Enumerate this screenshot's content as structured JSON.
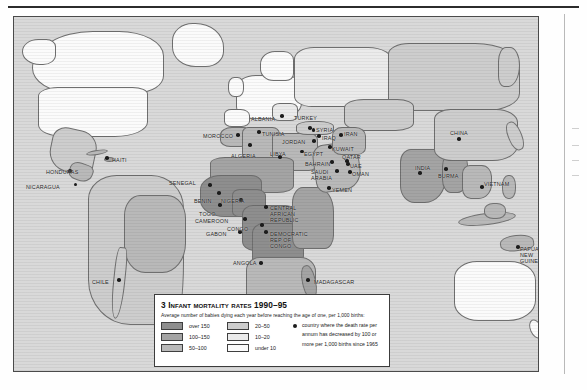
{
  "page": {
    "figure_number": "3",
    "map_title": "Infant mortality rates 1990–95"
  },
  "legend": {
    "title_number": "3",
    "title_text": "Infant mortality rates 1990–95",
    "subtitle": "Average number of babies dying each year before reaching the age of one, per 1,000 births:",
    "swatch_keys": [
      {
        "label": "over 150",
        "color": "#8e8e8e"
      },
      {
        "label": "100–150",
        "color": "#a4a4a4"
      },
      {
        "label": "50–100",
        "color": "#b9b9b9"
      },
      {
        "label": "20–50",
        "color": "#cdcdcd"
      },
      {
        "label": "10–20",
        "color": "#ebebeb"
      },
      {
        "label": "under 10",
        "color": "#fbfbfb"
      }
    ],
    "dot_note_lines": [
      "country where the death rate per",
      "annum has decreased by 100 or",
      "more per 1,000 births since 1965"
    ]
  },
  "chart_data": {
    "type": "map",
    "title": "3 Infant mortality rates 1990–95",
    "subtitle": "Average number of babies dying each year before reaching the age of one, per 1,000 births:",
    "projection": "world",
    "legend_position": "bottom-center",
    "classes": [
      {
        "label": "over 150",
        "range": [
          150,
          null
        ],
        "color": "#8e8e8e"
      },
      {
        "label": "100–150",
        "range": [
          100,
          150
        ],
        "color": "#a4a4a4"
      },
      {
        "label": "50–100",
        "range": [
          50,
          100
        ],
        "color": "#b9b9b9"
      },
      {
        "label": "20–50",
        "range": [
          20,
          50
        ],
        "color": "#cdcdcd"
      },
      {
        "label": "10–20",
        "range": [
          10,
          20
        ],
        "color": "#ebebeb"
      },
      {
        "label": "under 10",
        "range": [
          null,
          10
        ],
        "color": "#fbfbfb"
      }
    ],
    "marker_meaning": "country where the death rate per annum has decreased by 100 or more per 1,000 births since 1965",
    "labelled_countries": [
      "NICARAGUA",
      "HONDURAS",
      "HAITI",
      "CHILE",
      "MOROCCO",
      "ALGERIA",
      "TUNISIA",
      "LIBYA",
      "ALBANIA",
      "TURKEY",
      "SYRIA",
      "IRAQ",
      "IRAN",
      "JORDAN",
      "EGYPT",
      "KUWAIT",
      "QATAR",
      "BAHRAIN",
      "UAE",
      "SAUDI ARABIA",
      "OMAN",
      "YEMEN",
      "SENEGAL",
      "BENIN",
      "NIGERIA",
      "TOGO",
      "CAMEROON",
      "GABON",
      "CONGO",
      "CENTRAL AFRICAN REPUBLIC",
      "DEMOCRATIC REP OF CONGO",
      "ANGOLA",
      "MADAGASCAR",
      "CHINA",
      "INDIA",
      "BURMA",
      "VIETNAM",
      "PAPUA NEW GUINEA"
    ]
  },
  "map": {
    "labels": [
      {
        "name": "NICARAGUA",
        "text": "NICARAGUA",
        "x": 12,
        "y": 167,
        "align": "left",
        "dot": [
          61.5,
          167.5
        ]
      },
      {
        "name": "HONDURAS",
        "text": "HONDURAS",
        "x": 32,
        "y": 152,
        "align": "left",
        "dot": [
          56.0,
          154.0
        ]
      },
      {
        "name": "HAITI",
        "text": "HAITI",
        "x": 98,
        "y": 140,
        "align": "left",
        "dot": [
          93.0,
          141.0
        ]
      },
      {
        "name": "CHILE",
        "text": "CHILE",
        "x": 78,
        "y": 262,
        "align": "left",
        "dot": [
          105.0,
          263.0
        ]
      },
      {
        "name": "MOROCCO",
        "text": "MOROCCO",
        "x": 189,
        "y": 116,
        "align": "left",
        "dot": [
          224.0,
          118.0
        ]
      },
      {
        "name": "ALGERIA",
        "text": "ALGERIA",
        "x": 217,
        "y": 136,
        "align": "left",
        "dot": [
          236.0,
          128.0
        ]
      },
      {
        "name": "TUNISIA",
        "text": "TUNISIA",
        "x": 248,
        "y": 114,
        "align": "left",
        "dot": [
          245.0,
          115.0
        ]
      },
      {
        "name": "LIBYA",
        "text": "LIBYA",
        "x": 256,
        "y": 134,
        "align": "left",
        "dot": [
          266.0,
          140.0
        ]
      },
      {
        "name": "ALBANIA",
        "text": "ALBANIA",
        "x": 237,
        "y": 99,
        "align": "left",
        "dot": [
          268.0,
          99.0
        ]
      },
      {
        "name": "TURKEY",
        "text": "TURKEY",
        "x": 280,
        "y": 98,
        "align": "left",
        "dot": [
          296.0,
          111.0
        ]
      },
      {
        "name": "SYRIA",
        "text": "SYRIA",
        "x": 302,
        "y": 110,
        "align": "left",
        "dot": [
          299.5,
          113.0
        ]
      },
      {
        "name": "IRAQ",
        "text": "IRAQ",
        "x": 308,
        "y": 118,
        "align": "left",
        "dot": [
          305.0,
          119.0
        ]
      },
      {
        "name": "IRAN",
        "text": "IRAN",
        "x": 330,
        "y": 114,
        "align": "left",
        "dot": [
          327.0,
          118.0
        ]
      },
      {
        "name": "JORDAN",
        "text": "JORDAN",
        "x": 268,
        "y": 122,
        "align": "left",
        "dot": [
          300.0,
          124.0
        ]
      },
      {
        "name": "EGYPT",
        "text": "EGYPT",
        "x": 290,
        "y": 134,
        "align": "left",
        "dot": [
          288.0,
          134.5
        ]
      },
      {
        "name": "KUWAIT",
        "text": "KUWAIT",
        "x": 318,
        "y": 129,
        "align": "left",
        "dot": [
          316.0,
          130.0
        ]
      },
      {
        "name": "QATAR",
        "text": "QATAR",
        "x": 328,
        "y": 137,
        "align": "left",
        "dot": [
          333.0,
          144.0
        ]
      },
      {
        "name": "BAHRAIN",
        "text": "BAHRAIN",
        "x": 291,
        "y": 144,
        "align": "left",
        "dot": [
          318.0,
          145.0
        ]
      },
      {
        "name": "UAE",
        "text": "UAE",
        "x": 336,
        "y": 146,
        "align": "left",
        "dot": [
          334.0,
          147.0
        ]
      },
      {
        "name": "SAUDI ARABIA",
        "text": "SAUDI\nARABIA",
        "x": 297,
        "y": 152,
        "align": "left",
        "dot": [
          323.0,
          154.0
        ]
      },
      {
        "name": "OMAN",
        "text": "OMAN",
        "x": 338,
        "y": 154,
        "align": "left",
        "dot": [
          336.0,
          155.0
        ]
      },
      {
        "name": "YEMEN",
        "text": "YEMEN",
        "x": 318,
        "y": 170,
        "align": "left",
        "dot": [
          315.0,
          171.0
        ]
      },
      {
        "name": "SENEGAL",
        "text": "SENEGAL",
        "x": 155,
        "y": 163,
        "align": "left",
        "dot": [
          196.0,
          168.0
        ]
      },
      {
        "name": "BENIN",
        "text": "BENIN",
        "x": 180,
        "y": 181,
        "align": "left",
        "dot": [
          205.0,
          176.0
        ]
      },
      {
        "name": "NIGERIA",
        "text": "NIGERIA",
        "x": 207,
        "y": 181,
        "align": "left",
        "dot": [
          227.0,
          183.0
        ]
      },
      {
        "name": "TOGO",
        "text": "TOGO",
        "x": 185,
        "y": 194,
        "align": "left",
        "dot": [
          206.0,
          188.0
        ]
      },
      {
        "name": "CAMEROON",
        "text": "CAMEROON",
        "x": 181,
        "y": 201,
        "align": "left",
        "dot": [
          231.0,
          202.0
        ]
      },
      {
        "name": "GABON",
        "text": "GABON",
        "x": 192,
        "y": 214,
        "align": "left",
        "dot": [
          226.0,
          215.0
        ]
      },
      {
        "name": "CONGO",
        "text": "CONGO",
        "x": 213,
        "y": 209,
        "align": "left",
        "dot": [
          248.0,
          208.0
        ]
      },
      {
        "name": "CENTRAL AFRICAN REPUBLIC",
        "text": "CENTRAL AFRICAN\nREPUBLIC",
        "x": 256,
        "y": 188,
        "align": "left",
        "dot": [
          252.0,
          190.0
        ]
      },
      {
        "name": "DEMOCRATIC REP OF CONGO",
        "text": "DEMOCRATIC\nREP OF CONGO",
        "x": 256,
        "y": 214,
        "align": "left",
        "dot": [
          252.0,
          215.0
        ]
      },
      {
        "name": "ANGOLA",
        "text": "ANGOLA",
        "x": 219,
        "y": 243,
        "align": "left",
        "dot": [
          247.0,
          246.0
        ]
      },
      {
        "name": "MADAGASCAR",
        "text": "MADAGASCAR",
        "x": 300,
        "y": 262,
        "align": "left",
        "dot": [
          294.0,
          263.0
        ]
      },
      {
        "name": "CHINA",
        "text": "CHINA",
        "x": 436,
        "y": 113,
        "align": "left",
        "dot": [
          445.0,
          122.0
        ]
      },
      {
        "name": "INDIA",
        "text": "INDIA",
        "x": 401,
        "y": 148,
        "align": "left",
        "dot": [
          406.0,
          156.0
        ]
      },
      {
        "name": "BURMA",
        "text": "BURMA",
        "x": 424,
        "y": 156,
        "align": "left",
        "dot": [
          432.0,
          152.0
        ]
      },
      {
        "name": "VIETNAM",
        "text": "VIETNAM",
        "x": 470,
        "y": 164,
        "align": "left",
        "dot": [
          468.0,
          170.0
        ]
      },
      {
        "name": "PAPUA NEW GUINEA",
        "text": "PAPUA\nNEW\nGUINEA",
        "x": 506,
        "y": 229,
        "align": "left",
        "dot": [
          504.0,
          230.0
        ]
      }
    ]
  }
}
